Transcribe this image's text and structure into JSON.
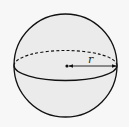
{
  "diagram": {
    "shape": "sphere",
    "radius_label": "r",
    "colors": {
      "background": "#f7f7f7",
      "fill": "#ebebeb",
      "stroke": "#111111"
    }
  }
}
